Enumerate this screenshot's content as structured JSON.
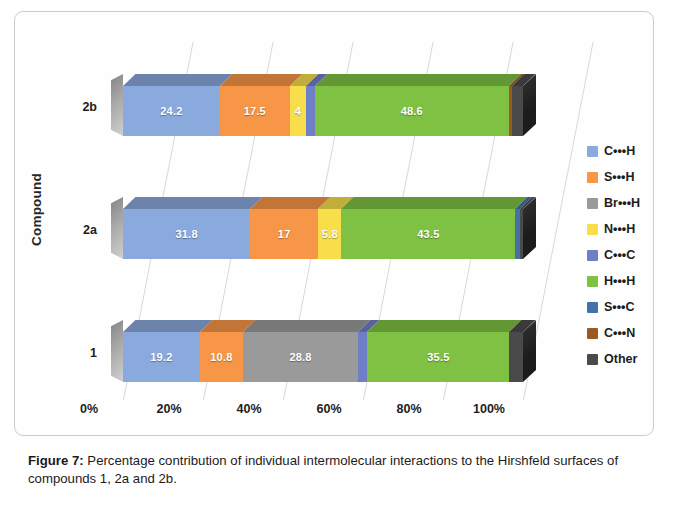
{
  "figure": {
    "caption_label": "Figure 7:",
    "caption_text": " Percentage contribution of individual intermolecular interactions to the Hirshfeld surfaces of compounds 1, 2a and 2b."
  },
  "axes": {
    "y_title": "Compound",
    "x_ticks": [
      "0%",
      "20%",
      "40%",
      "60%",
      "80%",
      "100%"
    ],
    "categories": [
      "2b",
      "2a",
      "1"
    ]
  },
  "legend": {
    "items": [
      {
        "label": "C•••H",
        "color": "#8aa9dd"
      },
      {
        "label": "S•••H",
        "color": "#f79646"
      },
      {
        "label": "Br•••H",
        "color": "#9a9a9a"
      },
      {
        "label": "N•••H",
        "color": "#f7de4a"
      },
      {
        "label": "C•••C",
        "color": "#6f7fc6"
      },
      {
        "label": "H•••H",
        "color": "#7fc142"
      },
      {
        "label": "S•••C",
        "color": "#4472a8"
      },
      {
        "label": "C•••N",
        "color": "#9c5a20"
      },
      {
        "label": "Other",
        "color": "#4a4a4a"
      }
    ]
  },
  "chart_data": {
    "type": "bar",
    "orientation": "horizontal",
    "stacked": true,
    "percent_stacked": true,
    "title": "",
    "xlabel": "",
    "ylabel": "Compound",
    "xlim": [
      0,
      100
    ],
    "xticks": [
      0,
      20,
      40,
      60,
      80,
      100
    ],
    "grid": true,
    "legend_position": "right",
    "categories": [
      "2b",
      "2a",
      "1"
    ],
    "series": [
      {
        "name": "C•••H",
        "color": "#8aa9dd",
        "values": [
          24.2,
          31.8,
          19.2
        ]
      },
      {
        "name": "S•••H",
        "color": "#f79646",
        "values": [
          17.5,
          17.0,
          10.8
        ]
      },
      {
        "name": "Br•••H",
        "color": "#9a9a9a",
        "values": [
          0,
          0,
          28.8
        ]
      },
      {
        "name": "N•••H",
        "color": "#f7de4a",
        "values": [
          4.0,
          5.8,
          0
        ]
      },
      {
        "name": "C•••C",
        "color": "#6f7fc6",
        "values": [
          2.2,
          0.6,
          2.3
        ]
      },
      {
        "name": "H•••H",
        "color": "#7fc142",
        "values": [
          48.6,
          43.5,
          35.5
        ]
      },
      {
        "name": "S•••C",
        "color": "#4472a8",
        "values": [
          0.6,
          0.8,
          0
        ]
      },
      {
        "name": "C•••N",
        "color": "#9c5a20",
        "values": [
          0.8,
          0,
          0
        ]
      },
      {
        "name": "Other",
        "color": "#4a4a4a",
        "values": [
          2.1,
          0.5,
          3.4
        ]
      }
    ],
    "bars": [
      {
        "category": "2b",
        "segments": [
          {
            "name": "C•••H",
            "value": 24.2,
            "label": "24.2",
            "color": "#8aa9dd"
          },
          {
            "name": "S•••H",
            "value": 17.5,
            "label": "17.5",
            "color": "#f79646"
          },
          {
            "name": "N•••H",
            "value": 4.0,
            "label": "4",
            "color": "#f7de4a"
          },
          {
            "name": "C•••C",
            "value": 2.2,
            "label": "",
            "color": "#6f7fc6"
          },
          {
            "name": "H•••H",
            "value": 48.6,
            "label": "48.6",
            "color": "#7fc142"
          },
          {
            "name": "C•••N",
            "value": 0.8,
            "label": "",
            "color": "#9c5a20"
          },
          {
            "name": "Other",
            "value": 2.7,
            "label": "",
            "color": "#4a4a4a"
          }
        ]
      },
      {
        "category": "2a",
        "segments": [
          {
            "name": "C•••H",
            "value": 31.8,
            "label": "31.8",
            "color": "#8aa9dd"
          },
          {
            "name": "S•••H",
            "value": 17.0,
            "label": "17",
            "color": "#f79646"
          },
          {
            "name": "N•••H",
            "value": 5.8,
            "label": "5.8",
            "color": "#f7de4a"
          },
          {
            "name": "H•••H",
            "value": 43.5,
            "label": "43.5",
            "color": "#7fc142"
          },
          {
            "name": "S•••C",
            "value": 1.1,
            "label": "",
            "color": "#4472a8"
          },
          {
            "name": "Other",
            "value": 0.8,
            "label": "",
            "color": "#4a4a4a"
          }
        ]
      },
      {
        "category": "1",
        "segments": [
          {
            "name": "C•••H",
            "value": 19.2,
            "label": "19.2",
            "color": "#8aa9dd"
          },
          {
            "name": "S•••H",
            "value": 10.8,
            "label": "10.8",
            "color": "#f79646"
          },
          {
            "name": "Br•••H",
            "value": 28.8,
            "label": "28.8",
            "color": "#9a9a9a"
          },
          {
            "name": "C•••C",
            "value": 2.3,
            "label": "",
            "color": "#6f7fc6"
          },
          {
            "name": "H•••H",
            "value": 35.5,
            "label": "35.5",
            "color": "#7fc142"
          },
          {
            "name": "Other",
            "value": 3.4,
            "label": "",
            "color": "#4a4a4a"
          }
        ]
      }
    ]
  }
}
